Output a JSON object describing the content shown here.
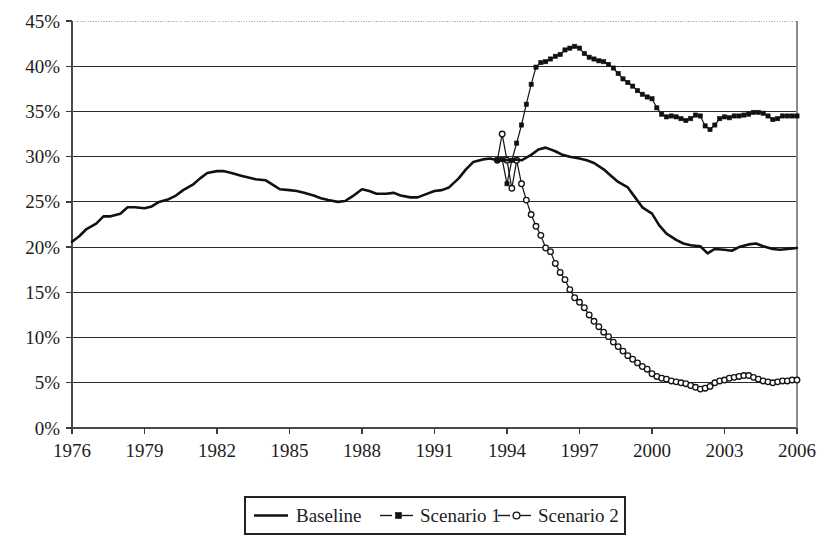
{
  "chart_data": {
    "type": "line",
    "title": "",
    "xlabel": "",
    "ylabel": "",
    "xlim": [
      1976,
      2006
    ],
    "ylim": [
      0,
      45
    ],
    "ytick_labels": [
      "45%",
      "40%",
      "35%",
      "30%",
      "25%",
      "20%",
      "15%",
      "10%",
      "5%",
      "0%"
    ],
    "ytick_values": [
      45,
      40,
      35,
      30,
      25,
      20,
      15,
      10,
      5,
      0
    ],
    "xtick_labels": [
      "1976",
      "1979",
      "1982",
      "1985",
      "1988",
      "1991",
      "1994",
      "1997",
      "2000",
      "2003",
      "2006"
    ],
    "xtick_values": [
      1976,
      1979,
      1982,
      1985,
      1988,
      1991,
      1994,
      1997,
      2000,
      2003,
      2006
    ],
    "grid": true,
    "legend_position": "bottom-center",
    "y_unit": "percent",
    "series": [
      {
        "name": "Baseline",
        "marker": "none",
        "color": "#111111",
        "x": [
          1976.0,
          1976.3,
          1976.6,
          1977.0,
          1977.3,
          1977.6,
          1978.0,
          1978.3,
          1978.6,
          1979.0,
          1979.3,
          1979.6,
          1980.0,
          1980.3,
          1980.6,
          1981.0,
          1981.3,
          1981.6,
          1982.0,
          1982.3,
          1982.6,
          1983.0,
          1983.3,
          1983.6,
          1984.0,
          1984.3,
          1984.6,
          1985.0,
          1985.3,
          1985.6,
          1986.0,
          1986.3,
          1986.6,
          1987.0,
          1987.3,
          1987.6,
          1988.0,
          1988.3,
          1988.6,
          1989.0,
          1989.3,
          1989.6,
          1990.0,
          1990.3,
          1990.6,
          1991.0,
          1991.3,
          1991.6,
          1992.0,
          1992.3,
          1992.6,
          1993.0,
          1993.3,
          1993.6,
          1994.0,
          1994.3,
          1994.6,
          1995.0,
          1995.3,
          1995.6,
          1996.0,
          1996.3,
          1996.6,
          1997.0,
          1997.3,
          1997.6,
          1998.0,
          1998.3,
          1998.6,
          1999.0,
          1999.3,
          1999.6,
          2000.0,
          2000.3,
          2000.6,
          2001.0,
          2001.3,
          2001.6,
          2002.0,
          2002.3,
          2002.6,
          2003.0,
          2003.3,
          2003.6,
          2004.0,
          2004.3,
          2004.6,
          2005.0,
          2005.3,
          2005.6,
          2006.0
        ],
        "y": [
          20.6,
          21.2,
          22.0,
          22.6,
          23.4,
          23.4,
          23.7,
          24.4,
          24.4,
          24.3,
          24.5,
          25.0,
          25.3,
          25.7,
          26.3,
          26.9,
          27.6,
          28.2,
          28.4,
          28.4,
          28.2,
          27.9,
          27.7,
          27.5,
          27.4,
          26.9,
          26.4,
          26.3,
          26.2,
          26.0,
          25.7,
          25.4,
          25.2,
          25.0,
          25.1,
          25.6,
          26.4,
          26.2,
          25.9,
          25.9,
          26.0,
          25.7,
          25.5,
          25.5,
          25.8,
          26.2,
          26.3,
          26.6,
          27.6,
          28.6,
          29.4,
          29.7,
          29.8,
          29.6,
          29.6,
          29.7,
          29.6,
          30.2,
          30.8,
          31.0,
          30.6,
          30.2,
          30.0,
          29.8,
          29.6,
          29.3,
          28.6,
          27.9,
          27.2,
          26.6,
          25.5,
          24.4,
          23.7,
          22.4,
          21.5,
          20.8,
          20.4,
          20.2,
          20.1,
          19.3,
          19.8,
          19.7,
          19.6,
          20.0,
          20.3,
          20.4,
          20.1,
          19.8,
          19.7,
          19.8,
          19.9
        ]
      },
      {
        "name": "Scenario 1",
        "marker": "filled-square",
        "color": "#1a1a1a",
        "x": [
          1993.6,
          1993.8,
          1994.0,
          1994.2,
          1994.4,
          1994.6,
          1994.8,
          1995.0,
          1995.2,
          1995.4,
          1995.6,
          1995.8,
          1996.0,
          1996.2,
          1996.4,
          1996.6,
          1996.8,
          1997.0,
          1997.2,
          1997.4,
          1997.6,
          1997.8,
          1998.0,
          1998.2,
          1998.4,
          1998.6,
          1998.8,
          1999.0,
          1999.2,
          1999.4,
          1999.6,
          1999.8,
          2000.0,
          2000.2,
          2000.4,
          2000.6,
          2000.8,
          2001.0,
          2001.2,
          2001.4,
          2001.6,
          2001.8,
          2002.0,
          2002.2,
          2002.4,
          2002.6,
          2002.8,
          2003.0,
          2003.2,
          2003.4,
          2003.6,
          2003.8,
          2004.0,
          2004.2,
          2004.4,
          2004.6,
          2004.8,
          2005.0,
          2005.2,
          2005.4,
          2005.6,
          2005.8,
          2006.0
        ],
        "y": [
          29.6,
          29.7,
          27.0,
          29.6,
          31.5,
          33.5,
          35.8,
          38.0,
          39.9,
          40.4,
          40.5,
          40.8,
          41.1,
          41.3,
          41.8,
          42.0,
          42.2,
          42.0,
          41.4,
          41.0,
          40.8,
          40.6,
          40.5,
          40.2,
          39.8,
          39.2,
          38.6,
          38.2,
          37.8,
          37.3,
          36.9,
          36.6,
          36.4,
          35.4,
          34.7,
          34.4,
          34.5,
          34.4,
          34.2,
          34.0,
          34.2,
          34.6,
          34.5,
          33.4,
          33.0,
          33.5,
          34.2,
          34.4,
          34.3,
          34.5,
          34.5,
          34.6,
          34.7,
          34.9,
          34.9,
          34.8,
          34.5,
          34.1,
          34.2,
          34.5,
          34.5,
          34.5,
          34.5
        ]
      },
      {
        "name": "Scenario 2",
        "marker": "open-circle",
        "color": "#1a1a1a",
        "x": [
          1993.6,
          1993.8,
          1994.0,
          1994.2,
          1994.4,
          1994.6,
          1994.8,
          1995.0,
          1995.2,
          1995.4,
          1995.6,
          1995.8,
          1996.0,
          1996.2,
          1996.4,
          1996.6,
          1996.8,
          1997.0,
          1997.2,
          1997.4,
          1997.6,
          1997.8,
          1998.0,
          1998.2,
          1998.4,
          1998.6,
          1998.8,
          1999.0,
          1999.2,
          1999.4,
          1999.6,
          1999.8,
          2000.0,
          2000.2,
          2000.4,
          2000.6,
          2000.8,
          2001.0,
          2001.2,
          2001.4,
          2001.6,
          2001.8,
          2002.0,
          2002.2,
          2002.4,
          2002.6,
          2002.8,
          2003.0,
          2003.2,
          2003.4,
          2003.6,
          2003.8,
          2004.0,
          2004.2,
          2004.4,
          2004.6,
          2004.8,
          2005.0,
          2005.2,
          2005.4,
          2005.6,
          2005.8,
          2006.0
        ],
        "y": [
          29.6,
          32.5,
          29.6,
          26.5,
          29.6,
          27.0,
          25.2,
          23.6,
          22.3,
          21.3,
          19.9,
          19.5,
          18.2,
          17.2,
          16.4,
          15.3,
          14.4,
          13.9,
          13.3,
          12.5,
          11.8,
          11.2,
          10.6,
          10.1,
          9.5,
          9.0,
          8.5,
          8.0,
          7.6,
          7.2,
          6.8,
          6.5,
          6.0,
          5.7,
          5.5,
          5.4,
          5.2,
          5.1,
          5.0,
          4.9,
          4.7,
          4.5,
          4.3,
          4.4,
          4.6,
          5.0,
          5.2,
          5.3,
          5.5,
          5.6,
          5.7,
          5.8,
          5.8,
          5.6,
          5.4,
          5.2,
          5.1,
          5.0,
          5.1,
          5.2,
          5.2,
          5.3,
          5.3
        ]
      }
    ],
    "legend": [
      {
        "label": "Baseline",
        "marker": "none"
      },
      {
        "label": "Scenario 1",
        "marker": "filled-square"
      },
      {
        "label": "Scenario 2",
        "marker": "open-circle"
      }
    ]
  }
}
